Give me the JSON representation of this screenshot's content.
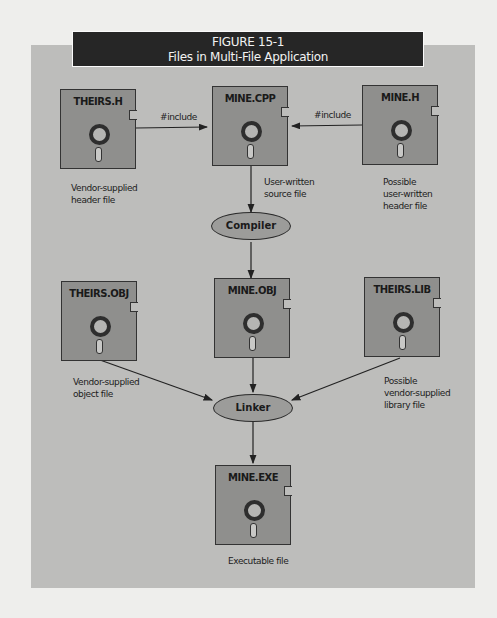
{
  "figure": {
    "number": "FIGURE 15-1",
    "title": "Files in Multi-File Application"
  },
  "nodes": {
    "theirs_h": {
      "label": "THEIRS.H",
      "caption": [
        "Vendor-supplied",
        "header file"
      ]
    },
    "mine_cpp": {
      "label": "MINE.CPP",
      "caption": [
        "User-written",
        "source file"
      ]
    },
    "mine_h": {
      "label": "MINE.H",
      "caption": [
        "Possible",
        "user-written",
        "header file"
      ]
    },
    "compiler": {
      "label": "Compiler"
    },
    "theirs_obj": {
      "label": "THEIRS.OBJ",
      "caption": [
        "Vendor-supplied",
        "object file"
      ]
    },
    "mine_obj": {
      "label": "MINE.OBJ"
    },
    "theirs_lib": {
      "label": "THEIRS.LIB",
      "caption": [
        "Possible",
        "vendor-supplied",
        "library file"
      ]
    },
    "linker": {
      "label": "Linker"
    },
    "mine_exe": {
      "label": "MINE.EXE",
      "caption": [
        "Executable file"
      ]
    }
  },
  "edges": [
    {
      "from": "THEIRS.H",
      "to": "MINE.CPP",
      "label": "#include"
    },
    {
      "from": "MINE.H",
      "to": "MINE.CPP",
      "label": "#include"
    },
    {
      "from": "MINE.CPP",
      "to": "Compiler",
      "label": ""
    },
    {
      "from": "Compiler",
      "to": "MINE.OBJ",
      "label": ""
    },
    {
      "from": "THEIRS.OBJ",
      "to": "Linker",
      "label": ""
    },
    {
      "from": "MINE.OBJ",
      "to": "Linker",
      "label": ""
    },
    {
      "from": "THEIRS.LIB",
      "to": "Linker",
      "label": ""
    },
    {
      "from": "Linker",
      "to": "MINE.EXE",
      "label": ""
    }
  ]
}
